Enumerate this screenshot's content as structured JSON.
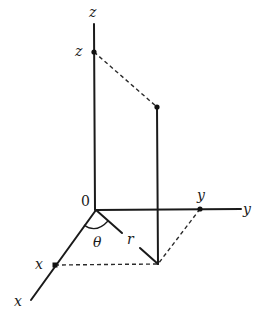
{
  "diagram": {
    "labels": {
      "z_axis": "z",
      "z_point": "z",
      "origin": "0",
      "y_axis": "y",
      "y_point": "y",
      "x_axis": "x",
      "x_point": "x",
      "theta": "θ",
      "r": "r"
    },
    "points": {
      "origin": [
        96,
        210
      ],
      "z_axis_end": [
        94,
        24
      ],
      "z_point": [
        94,
        52
      ],
      "y_axis_end": [
        241,
        209
      ],
      "y_point": [
        200,
        209
      ],
      "x_axis_end": [
        31,
        300
      ],
      "x_point": [
        55,
        265
      ],
      "base_point": [
        158,
        264
      ],
      "elevated_point": [
        157,
        107
      ]
    },
    "colors": {
      "ink": "#1a1a1a",
      "background": "#ffffff"
    }
  }
}
